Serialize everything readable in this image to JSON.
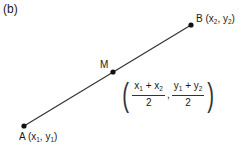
{
  "panel_label": "(b)",
  "points": {
    "A": {
      "name": "A",
      "coord_x": "x",
      "coord_x_sub": "1",
      "coord_y": "y",
      "coord_y_sub": "1",
      "px": 24,
      "py": 126
    },
    "B": {
      "name": "B",
      "coord_x": "x",
      "coord_x_sub": "2",
      "coord_y": "y",
      "coord_y_sub": "2",
      "px": 191,
      "py": 25
    },
    "M": {
      "name": "M",
      "px": 113,
      "py": 72
    }
  },
  "formula": {
    "left_num_a": "x",
    "left_num_a_sub": "1",
    "plus": "+",
    "left_num_b": "x",
    "left_num_b_sub": "2",
    "left_den": "2",
    "comma": ",",
    "right_num_a": "y",
    "right_num_a_sub": "1",
    "right_num_b": "y",
    "right_num_b_sub": "2",
    "right_den": "2",
    "open_paren": "(",
    "close_paren": ")"
  },
  "colors": {
    "line": "#333333",
    "point": "#111111",
    "text": "#1a1a1a"
  }
}
